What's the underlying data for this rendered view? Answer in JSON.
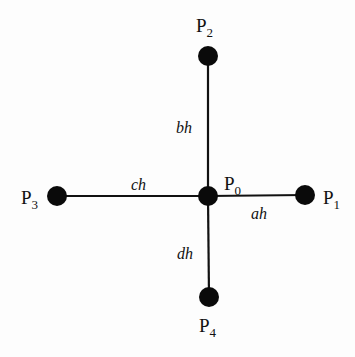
{
  "diagram": {
    "type": "five-point stencil",
    "nodes": [
      {
        "id": "P0",
        "base": "P",
        "sub": "0",
        "x": 208,
        "y": 196,
        "label_x": 224,
        "label_y": 190
      },
      {
        "id": "P1",
        "base": "P",
        "sub": "1",
        "x": 305,
        "y": 195,
        "label_x": 323,
        "label_y": 204
      },
      {
        "id": "P2",
        "base": "P",
        "sub": "2",
        "x": 208,
        "y": 56,
        "label_x": 196,
        "label_y": 32
      },
      {
        "id": "P3",
        "base": "P",
        "sub": "3",
        "x": 57,
        "y": 196,
        "label_x": 21,
        "label_y": 204
      },
      {
        "id": "P4",
        "base": "P",
        "sub": "4",
        "x": 209,
        "y": 297,
        "label_x": 199,
        "label_y": 332
      }
    ],
    "edges": [
      {
        "from": "P0",
        "to": "P1",
        "label": "ah",
        "label_x": 251,
        "label_y": 219
      },
      {
        "from": "P0",
        "to": "P2",
        "label": "bh",
        "label_x": 176,
        "label_y": 133
      },
      {
        "from": "P0",
        "to": "P3",
        "label": "ch",
        "label_x": 131,
        "label_y": 190
      },
      {
        "from": "P0",
        "to": "P4",
        "label": "dh",
        "label_x": 177,
        "label_y": 259
      }
    ],
    "colors": {
      "line": "#111111",
      "node": "#0a0a0a",
      "background": "#fdfdfd"
    }
  }
}
